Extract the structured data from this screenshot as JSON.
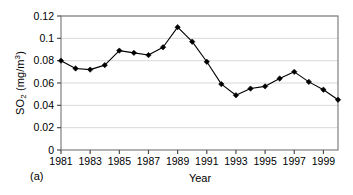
{
  "chart_data": {
    "type": "line",
    "title": "",
    "panel_label": "(a)",
    "xlabel": "Year",
    "ylabel": "SO2 (mg/m3)",
    "ylabel_parts": {
      "base": "SO",
      "sub": "2",
      "unit_prefix": " (mg/m",
      "sup": "3",
      "unit_suffix": ")"
    },
    "x": [
      1981,
      1982,
      1983,
      1984,
      1985,
      1986,
      1987,
      1988,
      1989,
      1990,
      1991,
      1992,
      1993,
      1994,
      1995,
      1996,
      1997,
      1998,
      1999,
      2000
    ],
    "values": [
      0.08,
      0.073,
      0.072,
      0.076,
      0.089,
      0.087,
      0.085,
      0.092,
      0.11,
      0.097,
      0.079,
      0.059,
      0.049,
      0.055,
      0.057,
      0.064,
      0.07,
      0.061,
      0.054,
      0.045
    ],
    "series": [
      {
        "name": "SO2",
        "values": [
          0.08,
          0.073,
          0.072,
          0.076,
          0.089,
          0.087,
          0.085,
          0.092,
          0.11,
          0.097,
          0.079,
          0.059,
          0.049,
          0.055,
          0.057,
          0.064,
          0.07,
          0.061,
          0.054,
          0.045
        ]
      }
    ],
    "xlim": [
      1981,
      2000
    ],
    "ylim": [
      0,
      0.12
    ],
    "ytick_labels": [
      "0",
      "0.02",
      "0.04",
      "0.06",
      "0.08",
      "0.1",
      "0.12"
    ],
    "ytick_values": [
      0,
      0.02,
      0.04,
      0.06,
      0.08,
      0.1,
      0.12
    ],
    "xtick_labels": [
      "1981",
      "1983",
      "1985",
      "1987",
      "1989",
      "1991",
      "1993",
      "1995",
      "1997",
      "1999"
    ],
    "xtick_values": [
      1981,
      1983,
      1985,
      1987,
      1989,
      1991,
      1993,
      1995,
      1997,
      1999
    ],
    "grid": "horizontal",
    "legend": "none",
    "marker": "diamond",
    "line_color": "#000000",
    "marker_color": "#000000",
    "grid_color": "#d9d9d9",
    "axis_color": "#808080",
    "background": "#ffffff"
  }
}
